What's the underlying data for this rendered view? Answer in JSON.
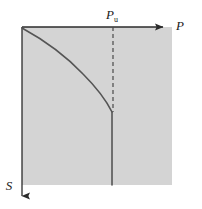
{
  "figure": {
    "type": "schematic-plot",
    "background_color": "#ffffff",
    "region": {
      "name": "shaded-domain",
      "fill_color": "#d4d4d4",
      "x": 22,
      "y": 27,
      "width": 150,
      "height": 158
    },
    "axes": {
      "horizontal": {
        "label": "P",
        "label_x": 180,
        "label_y": 30,
        "x1": 22,
        "y1": 27,
        "x2": 163,
        "y2": 27,
        "arrow": "right",
        "color": "#2b2b2b"
      },
      "vertical": {
        "label": "S",
        "label_x": 8,
        "label_y": 190,
        "x1": 22,
        "y1": 27,
        "x2": 22,
        "y2": 196,
        "arrow": "down",
        "color": "#2b2b2b"
      }
    },
    "markers": {
      "critical_pressure": {
        "label_base": "P",
        "label_sub": "u",
        "label_x": 106,
        "label_y": 19,
        "dashed_line": {
          "x": 113,
          "y_top": 27,
          "y_bottom": 112,
          "dash_pattern": "4 3",
          "color": "#4a4a4a"
        }
      }
    },
    "curves": [
      {
        "name": "equilibrium-branch",
        "style": "solid",
        "color": "#555555",
        "width": 1.6,
        "points": [
          [
            22,
            28
          ],
          [
            48,
            44
          ],
          [
            68,
            60
          ],
          [
            85,
            76
          ],
          [
            98,
            92
          ],
          [
            107,
            104
          ],
          [
            112,
            112
          ]
        ]
      },
      {
        "name": "vertical-branch",
        "style": "solid",
        "color": "#555555",
        "width": 1.6,
        "points": [
          [
            112,
            112
          ],
          [
            112,
            185
          ]
        ]
      }
    ]
  }
}
